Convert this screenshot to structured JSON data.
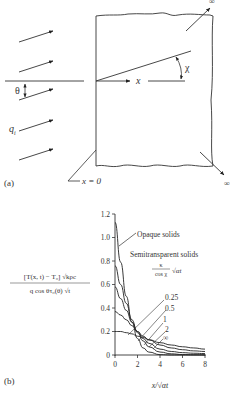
{
  "panel_a": {
    "label": "(a)",
    "incident_flux_label": "q",
    "incident_flux_subscript": "i",
    "incidence_angle_label": "θ",
    "refraction_angle_label": "χ",
    "axis_label": "x",
    "origin_label": "x = 0",
    "infinity_top": "∞",
    "infinity_bottom": "∞"
  },
  "panel_b": {
    "label": "(b)",
    "ylabel_numerator": "[T(x, t) − T₀] √kρc",
    "ylabel_denominator": "q cos θτ₀(θ) √t",
    "xlabel": "x/√αt",
    "annotation_opaque": "Opaque solids",
    "annotation_semi": "Semitransparent solids",
    "param_num": "κ",
    "param_den": "cos χ",
    "param_sqrt": "√αt",
    "curve_labels": [
      "0.25",
      "0.5",
      "1",
      "2",
      "∞"
    ]
  },
  "chart_data": {
    "type": "line",
    "title": "",
    "xlabel": "x/√(αt)",
    "ylabel": "[T(x,t) − T0] √(kρc) / (q_i cos θ τ0(θ) √t)",
    "xlim": [
      0,
      8
    ],
    "ylim": [
      0,
      1.2
    ],
    "xticks": [
      0,
      2,
      4,
      6,
      8
    ],
    "yticks": [
      0,
      0.2,
      0.4,
      0.6,
      0.8,
      1.0,
      1.2
    ],
    "grid": false,
    "legend": "inline annotations",
    "x": [
      0,
      0.5,
      1,
      1.5,
      2,
      2.5,
      3,
      4,
      5,
      6,
      7,
      8
    ],
    "series": [
      {
        "name": "Opaque solids (∞)",
        "values": [
          1.13,
          0.79,
          0.5,
          0.28,
          0.14,
          0.06,
          0.025,
          0.003,
          0,
          0,
          0,
          0
        ]
      },
      {
        "name": "0.25",
        "values": [
          0.76,
          0.6,
          0.44,
          0.3,
          0.19,
          0.12,
          0.07,
          0.025,
          0.01,
          0.004,
          0.002,
          0.001
        ]
      },
      {
        "name": "0.5",
        "values": [
          0.58,
          0.48,
          0.38,
          0.28,
          0.2,
          0.14,
          0.1,
          0.05,
          0.03,
          0.02,
          0.015,
          0.012
        ]
      },
      {
        "name": "1",
        "values": [
          0.37,
          0.34,
          0.3,
          0.25,
          0.2,
          0.16,
          0.13,
          0.085,
          0.06,
          0.045,
          0.035,
          0.03
        ]
      },
      {
        "name": "2",
        "values": [
          0.2,
          0.2,
          0.19,
          0.18,
          0.16,
          0.15,
          0.13,
          0.105,
          0.085,
          0.07,
          0.06,
          0.05
        ]
      }
    ]
  }
}
